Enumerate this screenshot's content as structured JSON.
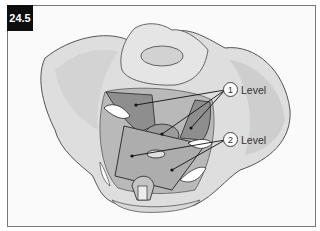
{
  "figure": {
    "number": "24.5"
  },
  "labels": [
    {
      "number": "1",
      "text": "Level"
    },
    {
      "number": "2",
      "text": "Level"
    }
  ],
  "colors": {
    "bone": "#dcdcdc",
    "bone_shade": "#bdbdbd",
    "muscle_dark": "#8f8f8f",
    "muscle_light": "#b5b5b5",
    "badge": "#0e0e0e"
  }
}
